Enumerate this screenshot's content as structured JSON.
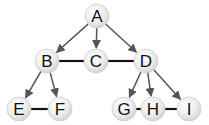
{
  "diagram": {
    "type": "graph",
    "colors": {
      "background": "#ffffff",
      "edge": "#555555",
      "undirected_edge": "#111111",
      "node_fill_light": "#ffffff",
      "node_fill_dark": "#d4d4d4",
      "node_stroke": "#cfcfcf",
      "label": "#111111"
    },
    "nodes": [
      {
        "id": "A",
        "label": "A",
        "x": 97,
        "y": 16
      },
      {
        "id": "B",
        "label": "B",
        "x": 47,
        "y": 61
      },
      {
        "id": "C",
        "label": "C",
        "x": 96,
        "y": 61
      },
      {
        "id": "D",
        "label": "D",
        "x": 146,
        "y": 61
      },
      {
        "id": "E",
        "label": "E",
        "x": 19,
        "y": 109
      },
      {
        "id": "F",
        "label": "F",
        "x": 60,
        "y": 109
      },
      {
        "id": "G",
        "label": "G",
        "x": 124,
        "y": 109
      },
      {
        "id": "H",
        "label": "H",
        "x": 153,
        "y": 109
      },
      {
        "id": "I",
        "label": "I",
        "x": 189,
        "y": 109
      }
    ],
    "edges": [
      {
        "from": "A",
        "to": "B",
        "directed": true
      },
      {
        "from": "A",
        "to": "C",
        "directed": true
      },
      {
        "from": "A",
        "to": "D",
        "directed": true
      },
      {
        "from": "B",
        "to": "C",
        "directed": false
      },
      {
        "from": "C",
        "to": "D",
        "directed": false
      },
      {
        "from": "B",
        "to": "E",
        "directed": true
      },
      {
        "from": "B",
        "to": "F",
        "directed": true
      },
      {
        "from": "E",
        "to": "F",
        "directed": false
      },
      {
        "from": "D",
        "to": "G",
        "directed": true
      },
      {
        "from": "D",
        "to": "H",
        "directed": true
      },
      {
        "from": "D",
        "to": "I",
        "directed": true
      },
      {
        "from": "G",
        "to": "H",
        "directed": false
      },
      {
        "from": "H",
        "to": "I",
        "directed": false
      }
    ],
    "node_radius": 12
  }
}
